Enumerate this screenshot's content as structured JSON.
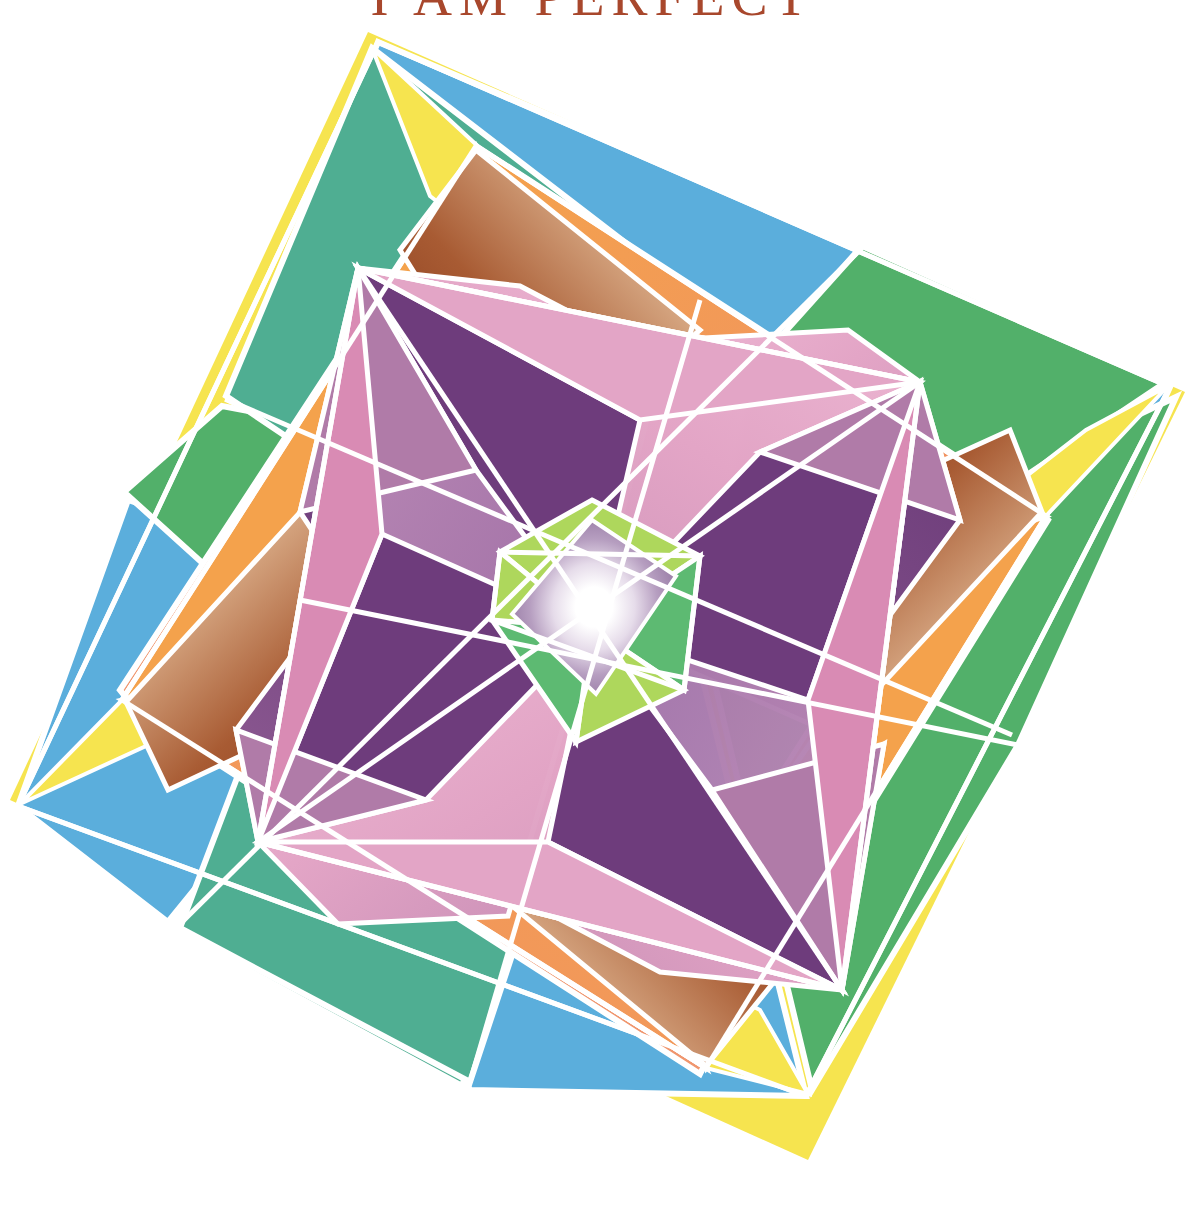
{
  "page": {
    "width": 1185,
    "height": 1221,
    "background": "#ffffff",
    "kind": "book-cover"
  },
  "title": {
    "text": "I AM PERFECT",
    "color": "#A8472C",
    "clipped_at_top": true
  },
  "artwork": {
    "name": "geometric-abstract-composition",
    "description": "Four-fold rotationally symmetric geometric composition of nested rotated squares and an overlaid pinwheel star with a glowing white centre.",
    "symmetry": "4-fold rotational",
    "center": [
      592,
      628
    ],
    "palette": {
      "white": "#ffffff",
      "yellow": "#F6E44F",
      "yellow_soft": "#F7D96A",
      "blue": "#5BAEDC",
      "teal": "#4FAE92",
      "green": "#52B06A",
      "green_deep": "#46A85F",
      "salmon": "#F0966E",
      "orange": "#F4A24C",
      "orange_deep": "#EE8A3C",
      "orange_vivid": "#F2792F",
      "brown_dark": "#8B3A1E",
      "brown_mid": "#A85B33",
      "purple": "#7A4182",
      "purple_deep": "#6B3C7B",
      "purple_light": "#9B6AA0",
      "pink": "#E8A7C8",
      "pink_mid": "#D98BB4",
      "pink_deep": "#C8719B",
      "mauve": "#B07BA8",
      "chartreuse": "#AED75C",
      "green_bright": "#5DBA72",
      "line": "#FFFFFF",
      "title_ink": "#A8472C"
    },
    "layers": [
      {
        "name": "outer-square-blue-green",
        "rotation_deg": -12,
        "colors": [
          "#5BAEDC",
          "#4FAE92",
          "#52B06A"
        ]
      },
      {
        "name": "yellow-edge-slivers",
        "colors": [
          "#F6E44F"
        ]
      },
      {
        "name": "mid-square-orange-salmon",
        "rotation_deg": 33,
        "colors": [
          "#F0966E",
          "#F4A24C",
          "#F7D96A"
        ]
      },
      {
        "name": "brown-gradient-corner-wedges",
        "colors": [
          "#8B3A1E",
          "#ffffff"
        ]
      },
      {
        "name": "inner-pinwheel-star",
        "colors": [
          "#7A4182",
          "#E8A7C8",
          "#9B6AA0"
        ]
      },
      {
        "name": "center-green-diamond",
        "colors": [
          "#AED75C",
          "#5DBA72"
        ]
      },
      {
        "name": "center-glow",
        "colors": [
          "#ffffff",
          "#9B7FA8"
        ]
      }
    ],
    "stroke": {
      "color": "#FFFFFF",
      "width_px": 5
    }
  }
}
